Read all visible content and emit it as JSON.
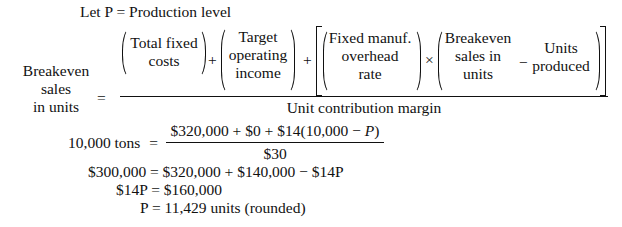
{
  "intro": "Let P = Production level",
  "formula": {
    "lhs_lines": [
      "Breakeven",
      "sales",
      "in units"
    ],
    "equals": "=",
    "numerator": {
      "term1_lines": [
        "Total fixed",
        "costs"
      ],
      "plus1": "+",
      "term2_lines": [
        "Target",
        "operating",
        "income"
      ],
      "plus2": "+",
      "term3_lines": [
        "Fixed manuf.",
        "overhead",
        "rate"
      ],
      "times": "×",
      "term4_lines": [
        "Breakeven",
        "sales in",
        "units"
      ],
      "minus": "−",
      "term5_lines": [
        "Units",
        "produced"
      ]
    },
    "denominator": "Unit contribution margin"
  },
  "solution": {
    "line1_lhs": "10,000 tons",
    "line1_equals": "=",
    "line1_numerator": "$320,000 + $0 + $14(10,000 − ",
    "line1_numerator_var": "P",
    "line1_numerator_close": ")",
    "line1_denominator": "$30",
    "line2": "$300,000 = $320,000 + $140,000 − $14P",
    "line3": "$14P = $160,000",
    "line4": "P = 11,429 units (rounded)"
  }
}
